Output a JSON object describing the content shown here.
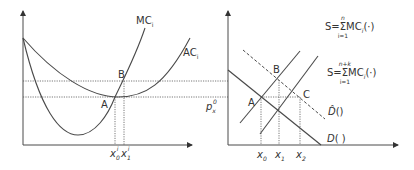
{
  "left_panel": {
    "curves": {
      "mc_label": "MC",
      "mc_sub": "i",
      "ac_label": "AC",
      "ac_sub": "i"
    },
    "points": {
      "a": "A",
      "b": "B"
    },
    "x_ticks": {
      "x0_base": "x",
      "x0_sub": "0",
      "x0_sup": "i",
      "x1_base": "x",
      "x1_sub": "1",
      "x1_sup": "i"
    }
  },
  "right_panel": {
    "supply_n": {
      "lhs": "S",
      "eq": "=",
      "sigma": "Σ",
      "upper": "n",
      "lower": "i=1",
      "term": "MC",
      "term_sub": "i",
      "arg": "(·)"
    },
    "supply_nk": {
      "lhs": "S",
      "eq": "=",
      "sigma": "Σ",
      "upper": "n+k",
      "lower": "i=1",
      "term": "MC",
      "term_sub": "i",
      "arg": "(·)"
    },
    "points": {
      "a": "A",
      "b": "B",
      "c": "C"
    },
    "price_label_base": "p",
    "price_label_sub": "x",
    "price_label_sup": "0",
    "demand_hat": "D̂",
    "demand_hat_arg": "()",
    "demand": "D",
    "demand_arg": "( )",
    "x_ticks": [
      {
        "base": "x",
        "sub": "0"
      },
      {
        "base": "x",
        "sub": "1"
      },
      {
        "base": "x",
        "sub": "2"
      }
    ]
  },
  "colors": {
    "line": "#4a4a4a",
    "text": "#333333",
    "background": "#ffffff"
  }
}
